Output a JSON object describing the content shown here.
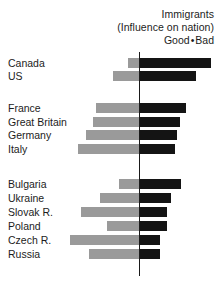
{
  "chart_data": {
    "type": "bar",
    "orientation": "horizontal",
    "layout": "diverging",
    "title": "Immigrants",
    "subtitle": "(Influence on nation)",
    "legend": {
      "position": "top-right",
      "entries": [
        {
          "name": "Good",
          "side": "left",
          "color": "#9a9a9a"
        },
        {
          "name": "Bad",
          "side": "right",
          "color": "#141414"
        }
      ],
      "separator": "•"
    },
    "xlabel": "",
    "ylabel": "",
    "grid": false,
    "axis_zero": true,
    "categories": [
      "Canada",
      "US",
      "France",
      "Great Britain",
      "Germany",
      "Italy",
      "Bulgaria",
      "Ukraine",
      "Slovak R.",
      "Poland",
      "Czech R.",
      "Russia"
    ],
    "groups": [
      {
        "name": "North America",
        "categories": [
          "Canada",
          "US"
        ]
      },
      {
        "name": "Western Europe",
        "categories": [
          "France",
          "Great Britain",
          "Germany",
          "Italy"
        ]
      },
      {
        "name": "Eastern Europe",
        "categories": [
          "Bulgaria",
          "Ukraine",
          "Slovak R.",
          "Poland",
          "Czech R.",
          "Russia"
        ]
      }
    ],
    "series": [
      {
        "name": "Good",
        "color": "#9a9a9a",
        "values": [
          11,
          26,
          43,
          46,
          53,
          61,
          20,
          39,
          58,
          32,
          69,
          50
        ]
      },
      {
        "name": "Bad",
        "color": "#141414",
        "values": [
          71,
          56,
          46,
          40,
          37,
          35,
          41,
          31,
          27,
          27,
          20,
          20
        ]
      }
    ]
  },
  "rows": [
    {
      "label": "Canada",
      "good": 11,
      "bad": 71,
      "top": 57,
      "gap_before": false
    },
    {
      "label": "US",
      "good": 26,
      "bad": 56,
      "top": 70,
      "gap_before": false
    },
    {
      "label": "France",
      "good": 43,
      "bad": 46,
      "top": 102,
      "gap_before": true
    },
    {
      "label": "Great Britain",
      "good": 46,
      "bad": 40,
      "top": 116,
      "gap_before": false
    },
    {
      "label": "Germany",
      "good": 53,
      "bad": 37,
      "top": 129,
      "gap_before": false
    },
    {
      "label": "Italy",
      "good": 61,
      "bad": 35,
      "top": 143,
      "gap_before": false
    },
    {
      "label": "Bulgaria",
      "good": 20,
      "bad": 41,
      "top": 178,
      "gap_before": true
    },
    {
      "label": "Ukraine",
      "good": 39,
      "bad": 31,
      "top": 192,
      "gap_before": false
    },
    {
      "label": "Slovak R.",
      "good": 58,
      "bad": 27,
      "top": 206,
      "gap_before": false
    },
    {
      "label": "Poland",
      "good": 32,
      "bad": 27,
      "top": 220,
      "gap_before": false
    },
    {
      "label": "Czech R.",
      "good": 69,
      "bad": 20,
      "top": 234,
      "gap_before": false
    },
    {
      "label": "Russia",
      "good": 50,
      "bad": 20,
      "top": 248,
      "gap_before": false
    }
  ],
  "geometry": {
    "axis_x": 139,
    "bar_height": 10
  }
}
